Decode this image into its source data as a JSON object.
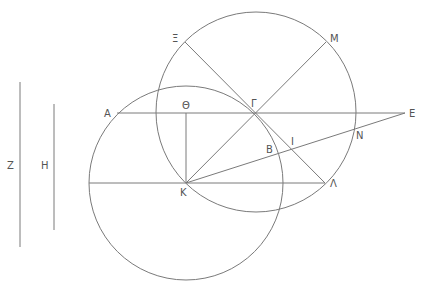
{
  "diagram": {
    "type": "geometric-construction",
    "stroke_color": "#7a7a7a",
    "label_color": "#555555",
    "points": {
      "A": {
        "label": "Α",
        "x": 117,
        "y": 113
      },
      "Theta": {
        "label": "Θ",
        "x": 186,
        "y": 113
      },
      "Gamma": {
        "label": "Γ",
        "x": 255,
        "y": 113
      },
      "E": {
        "label": "Ε",
        "x": 405,
        "y": 113
      },
      "K": {
        "label": "Κ",
        "x": 186,
        "y": 183
      },
      "Lambda": {
        "label": "Λ",
        "x": 325,
        "y": 183
      },
      "Xi": {
        "label": "Ξ",
        "x": 185,
        "y": 42
      },
      "M": {
        "label": "Μ",
        "x": 326,
        "y": 42
      },
      "N": {
        "label": "Ν",
        "x": 354,
        "y": 128
      },
      "I": {
        "label": "Ι",
        "x": 293,
        "y": 150
      },
      "B": {
        "label": "Β",
        "x": 281,
        "y": 153
      },
      "Z": {
        "label": "Ζ",
        "x": 20,
        "y": 165
      },
      "H": {
        "label": "Η",
        "x": 54,
        "y": 165
      }
    },
    "labels": {
      "Z": "Ζ",
      "H": "Η",
      "A": "Α",
      "Theta": "Θ",
      "Gamma": "Γ",
      "E": "Ε",
      "Xi": "Ξ",
      "M": "Μ",
      "I": "Ι",
      "N": "Ν",
      "B": "Β",
      "K": "Κ",
      "Lambda": "Λ"
    },
    "circles": [
      {
        "name": "circle-centered-K",
        "cx": 186,
        "cy": 183,
        "r": 97
      },
      {
        "name": "circle-centered-Gamma",
        "cx": 256,
        "cy": 112,
        "r": 100
      }
    ],
    "segments": [
      {
        "name": "line-Z",
        "from": "Z-top",
        "to": "Z-bottom"
      },
      {
        "name": "line-H",
        "from": "H-top",
        "to": "H-bottom"
      },
      {
        "name": "line-A-E",
        "from": "A",
        "to": "E"
      },
      {
        "name": "line-Theta-K",
        "from": "Theta",
        "to": "K"
      },
      {
        "name": "line-Xi-Lambda",
        "from": "Xi",
        "to": "Lambda"
      },
      {
        "name": "line-K-M",
        "from": "K",
        "to": "M"
      },
      {
        "name": "line-K-E",
        "from": "K",
        "to": "E"
      },
      {
        "name": "line-horizontal-K-Lambda",
        "from": "left-edge",
        "to": "Lambda"
      }
    ]
  }
}
